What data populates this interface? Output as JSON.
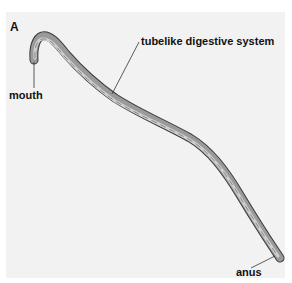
{
  "figure": {
    "panel_letter": "A",
    "labels": {
      "mouth": "mouth",
      "digestive": "tubelike digestive system",
      "anus": "anus"
    },
    "colors": {
      "panel_bg": "#f2f2f2",
      "body_outline": "#3a3a3a",
      "body_fill": "#9a9a9a",
      "gut_fill": "#cfcfcf",
      "leader_line": "#333333"
    }
  }
}
